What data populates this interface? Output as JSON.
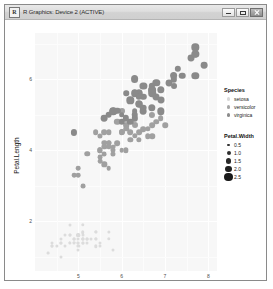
{
  "window": {
    "title": "R Graphics: Device 2 (ACTIVE)",
    "icon": "r-logo-icon",
    "minimize_label": "Minimize",
    "maximize_label": "Maximize",
    "close_label": "Close"
  },
  "chart_data": {
    "type": "scatter",
    "title": "",
    "xlabel": "Sepal.Length",
    "ylabel": "Petal.Length",
    "xlim": [
      4.0,
      8.2
    ],
    "ylim": [
      0.6,
      7.3
    ],
    "xticks": [
      5,
      6,
      7,
      8
    ],
    "yticks": [
      2,
      4,
      6
    ],
    "grid": true,
    "panel_background": "#f7f7f7",
    "grid_color": "#ffffff",
    "point_color": "#8c8c8c",
    "legend_position": "right",
    "legends": [
      {
        "title": "Species",
        "type": "color",
        "entries": [
          {
            "label": "setosa",
            "color": "#d9d9d9",
            "size": 1.6
          },
          {
            "label": "versicolor",
            "color": "#a6a6a6",
            "size": 1.6
          },
          {
            "label": "virginica",
            "color": "#8c8c8c",
            "size": 1.6
          }
        ]
      },
      {
        "title": "Petal.Width",
        "type": "size",
        "entries": [
          {
            "label": "0.5",
            "size": 1.4,
            "color": "#333333"
          },
          {
            "label": "1.0",
            "size": 2.0,
            "color": "#2e2e2e"
          },
          {
            "label": "1.5",
            "size": 2.7,
            "color": "#2a2a2a"
          },
          {
            "label": "2.0",
            "size": 3.4,
            "color": "#222222"
          },
          {
            "label": "2.5",
            "size": 4.2,
            "color": "#1a1a1a"
          }
        ]
      }
    ],
    "series": [
      {
        "name": "setosa",
        "color": "#dcdcdc",
        "points": [
          [
            5.1,
            1.4,
            0.2
          ],
          [
            4.9,
            1.4,
            0.2
          ],
          [
            4.7,
            1.3,
            0.2
          ],
          [
            4.6,
            1.5,
            0.2
          ],
          [
            5.0,
            1.4,
            0.2
          ],
          [
            5.4,
            1.7,
            0.4
          ],
          [
            4.6,
            1.4,
            0.3
          ],
          [
            5.0,
            1.5,
            0.2
          ],
          [
            4.4,
            1.4,
            0.2
          ],
          [
            4.9,
            1.5,
            0.1
          ],
          [
            5.4,
            1.5,
            0.2
          ],
          [
            4.8,
            1.6,
            0.2
          ],
          [
            4.8,
            1.4,
            0.1
          ],
          [
            4.3,
            1.1,
            0.1
          ],
          [
            5.8,
            1.2,
            0.2
          ],
          [
            5.7,
            1.5,
            0.4
          ],
          [
            5.4,
            1.3,
            0.4
          ],
          [
            5.1,
            1.4,
            0.3
          ],
          [
            5.7,
            1.7,
            0.3
          ],
          [
            5.1,
            1.5,
            0.3
          ],
          [
            5.4,
            1.7,
            0.2
          ],
          [
            5.1,
            1.5,
            0.4
          ],
          [
            4.6,
            1.0,
            0.2
          ],
          [
            5.1,
            1.7,
            0.5
          ],
          [
            4.8,
            1.9,
            0.2
          ],
          [
            5.0,
            1.6,
            0.2
          ],
          [
            5.0,
            1.6,
            0.4
          ],
          [
            5.2,
            1.5,
            0.2
          ],
          [
            5.2,
            1.4,
            0.2
          ],
          [
            4.7,
            1.6,
            0.2
          ],
          [
            4.8,
            1.6,
            0.2
          ],
          [
            5.4,
            1.5,
            0.4
          ],
          [
            5.2,
            1.5,
            0.1
          ],
          [
            5.5,
            1.4,
            0.2
          ],
          [
            4.9,
            1.5,
            0.2
          ],
          [
            5.0,
            1.2,
            0.2
          ],
          [
            5.5,
            1.3,
            0.2
          ],
          [
            4.9,
            1.4,
            0.1
          ],
          [
            4.4,
            1.3,
            0.2
          ],
          [
            5.1,
            1.5,
            0.2
          ],
          [
            5.0,
            1.3,
            0.3
          ],
          [
            4.5,
            1.3,
            0.3
          ],
          [
            4.4,
            1.3,
            0.2
          ],
          [
            5.0,
            1.6,
            0.6
          ],
          [
            5.1,
            1.9,
            0.4
          ],
          [
            4.8,
            1.4,
            0.3
          ],
          [
            5.1,
            1.6,
            0.2
          ],
          [
            4.6,
            1.4,
            0.2
          ],
          [
            5.3,
            1.5,
            0.2
          ],
          [
            5.0,
            1.4,
            0.2
          ]
        ]
      },
      {
        "name": "versicolor",
        "color": "#a0a0a0",
        "points": [
          [
            7.0,
            4.7,
            1.4
          ],
          [
            6.4,
            4.5,
            1.5
          ],
          [
            6.9,
            4.9,
            1.5
          ],
          [
            5.5,
            4.0,
            1.3
          ],
          [
            6.5,
            4.6,
            1.5
          ],
          [
            5.7,
            4.5,
            1.3
          ],
          [
            6.3,
            4.7,
            1.6
          ],
          [
            4.9,
            3.3,
            1.0
          ],
          [
            6.6,
            4.6,
            1.3
          ],
          [
            5.2,
            3.9,
            1.4
          ],
          [
            5.0,
            3.5,
            1.0
          ],
          [
            5.9,
            4.2,
            1.5
          ],
          [
            6.0,
            4.0,
            1.0
          ],
          [
            6.1,
            4.7,
            1.4
          ],
          [
            5.6,
            3.6,
            1.3
          ],
          [
            6.7,
            4.4,
            1.4
          ],
          [
            5.6,
            4.5,
            1.5
          ],
          [
            5.8,
            4.1,
            1.0
          ],
          [
            6.2,
            4.5,
            1.5
          ],
          [
            5.6,
            3.9,
            1.1
          ],
          [
            5.9,
            4.8,
            1.8
          ],
          [
            6.1,
            4.0,
            1.3
          ],
          [
            6.3,
            4.9,
            1.5
          ],
          [
            6.1,
            4.7,
            1.2
          ],
          [
            6.4,
            4.3,
            1.3
          ],
          [
            6.6,
            4.4,
            1.4
          ],
          [
            6.8,
            4.8,
            1.4
          ],
          [
            6.7,
            5.0,
            1.7
          ],
          [
            6.0,
            4.5,
            1.5
          ],
          [
            5.7,
            3.5,
            1.0
          ],
          [
            5.5,
            3.8,
            1.1
          ],
          [
            5.5,
            3.7,
            1.0
          ],
          [
            5.8,
            3.9,
            1.2
          ],
          [
            6.0,
            5.1,
            1.6
          ],
          [
            5.4,
            4.5,
            1.5
          ],
          [
            6.0,
            4.5,
            1.6
          ],
          [
            6.7,
            4.7,
            1.5
          ],
          [
            6.3,
            4.4,
            1.3
          ],
          [
            5.6,
            4.1,
            1.3
          ],
          [
            5.5,
            4.0,
            1.3
          ],
          [
            5.5,
            4.4,
            1.2
          ],
          [
            6.1,
            4.6,
            1.4
          ],
          [
            5.8,
            4.0,
            1.2
          ],
          [
            5.0,
            3.3,
            1.0
          ],
          [
            5.6,
            4.2,
            1.3
          ],
          [
            5.7,
            4.2,
            1.2
          ],
          [
            5.7,
            4.2,
            1.3
          ],
          [
            6.2,
            4.3,
            1.3
          ],
          [
            5.1,
            3.0,
            1.1
          ],
          [
            5.7,
            4.1,
            1.3
          ]
        ]
      },
      {
        "name": "virginica",
        "color": "#8a8a8a",
        "points": [
          [
            6.3,
            6.0,
            2.5
          ],
          [
            5.8,
            5.1,
            1.9
          ],
          [
            7.1,
            5.9,
            2.1
          ],
          [
            6.3,
            5.6,
            1.8
          ],
          [
            6.5,
            5.8,
            2.2
          ],
          [
            7.6,
            6.6,
            2.1
          ],
          [
            4.9,
            4.5,
            1.7
          ],
          [
            7.3,
            6.3,
            1.8
          ],
          [
            6.7,
            5.8,
            1.8
          ],
          [
            7.2,
            6.1,
            2.5
          ],
          [
            6.5,
            5.1,
            2.0
          ],
          [
            6.4,
            5.3,
            1.9
          ],
          [
            6.8,
            5.5,
            2.1
          ],
          [
            5.7,
            5.0,
            2.0
          ],
          [
            5.8,
            5.1,
            2.4
          ],
          [
            6.4,
            5.3,
            2.3
          ],
          [
            6.5,
            5.5,
            1.8
          ],
          [
            7.7,
            6.7,
            2.2
          ],
          [
            7.7,
            6.9,
            2.3
          ],
          [
            6.0,
            5.0,
            1.5
          ],
          [
            6.9,
            5.7,
            2.3
          ],
          [
            5.6,
            4.9,
            2.0
          ],
          [
            7.7,
            6.7,
            2.0
          ],
          [
            6.3,
            4.9,
            1.8
          ],
          [
            6.7,
            5.7,
            2.1
          ],
          [
            7.2,
            6.0,
            1.8
          ],
          [
            6.2,
            4.8,
            1.8
          ],
          [
            6.1,
            4.9,
            1.8
          ],
          [
            6.4,
            5.6,
            2.1
          ],
          [
            7.2,
            5.8,
            1.6
          ],
          [
            7.4,
            6.1,
            1.9
          ],
          [
            7.9,
            6.4,
            2.0
          ],
          [
            6.4,
            5.6,
            2.2
          ],
          [
            6.3,
            5.1,
            1.5
          ],
          [
            6.1,
            5.6,
            1.4
          ],
          [
            7.7,
            6.1,
            2.3
          ],
          [
            6.3,
            5.6,
            2.4
          ],
          [
            6.4,
            5.5,
            1.8
          ],
          [
            6.0,
            4.8,
            1.8
          ],
          [
            6.9,
            5.4,
            2.1
          ],
          [
            6.7,
            5.6,
            2.4
          ],
          [
            6.9,
            5.1,
            2.3
          ],
          [
            5.8,
            5.1,
            1.9
          ],
          [
            6.8,
            5.9,
            2.3
          ],
          [
            6.7,
            5.7,
            2.5
          ],
          [
            6.7,
            5.2,
            2.3
          ],
          [
            6.3,
            5.0,
            1.9
          ],
          [
            6.5,
            5.2,
            2.0
          ],
          [
            6.2,
            5.4,
            2.3
          ],
          [
            5.9,
            5.1,
            1.8
          ]
        ]
      }
    ]
  }
}
